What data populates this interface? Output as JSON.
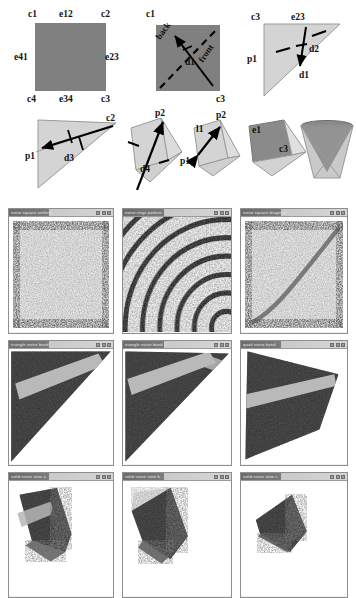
{
  "figure": {
    "domain": "paper-figure",
    "title_visible": false
  },
  "diagrams": {
    "row1": [
      {
        "id": "panel-square-corners",
        "shape": "square",
        "fill": "#808080",
        "labels": [
          {
            "text": "c1",
            "pos": "top-left"
          },
          {
            "text": "e12",
            "pos": "top-center"
          },
          {
            "text": "c2",
            "pos": "top-right"
          },
          {
            "text": "e41",
            "pos": "mid-left"
          },
          {
            "text": "e23",
            "pos": "mid-right"
          },
          {
            "text": "c4",
            "pos": "bottom-left"
          },
          {
            "text": "e34",
            "pos": "bottom-center"
          },
          {
            "text": "c3",
            "pos": "bottom-right"
          }
        ]
      },
      {
        "id": "panel-square-direction",
        "shape": "square",
        "fill": "#808080",
        "labels": [
          {
            "text": "c1",
            "pos": "top-left"
          },
          {
            "text": "c3",
            "pos": "bottom-right"
          },
          {
            "text": "back",
            "pos": "diagonal-upper"
          },
          {
            "text": "d1",
            "pos": "center"
          },
          {
            "text": "front",
            "pos": "diagonal-lower"
          }
        ]
      },
      {
        "id": "panel-triangle-d1-d2",
        "shape": "triangle",
        "fill": "#d4d4d4",
        "labels": [
          {
            "text": "c3",
            "pos": "top-left"
          },
          {
            "text": "e23",
            "pos": "top-center"
          },
          {
            "text": "p1",
            "pos": "mid-left"
          },
          {
            "text": "d2",
            "pos": "center"
          },
          {
            "text": "d1",
            "pos": "center-lower"
          }
        ]
      }
    ],
    "row2": [
      {
        "id": "panel-triangle-d3",
        "shape": "triangle",
        "fill": "#d4d4d4",
        "labels": [
          {
            "text": "c2",
            "pos": "top-right"
          },
          {
            "text": "p1",
            "pos": "mid-left"
          },
          {
            "text": "d3",
            "pos": "center"
          }
        ]
      },
      {
        "id": "panel-polyhedron-d4",
        "shape": "polyhedron",
        "fill": "#d4d4d4",
        "labels": [
          {
            "text": "p2",
            "pos": "top-right"
          },
          {
            "text": "d4",
            "pos": "center"
          }
        ]
      },
      {
        "id": "panel-polyhedron-l1",
        "shape": "polyhedron",
        "fill": "#d4d4d4",
        "labels": [
          {
            "text": "p2",
            "pos": "top-right"
          },
          {
            "text": "l1",
            "pos": "upper-left"
          },
          {
            "text": "p1",
            "pos": "mid-left"
          }
        ]
      },
      {
        "id": "panel-polyhedron-e1-c3",
        "shape": "polyhedron",
        "fill": "#d4d4d4",
        "labels": [
          {
            "text": "e1",
            "pos": "top-left"
          },
          {
            "text": "c3",
            "pos": "center"
          }
        ]
      },
      {
        "id": "panel-cone-wireframe",
        "shape": "cone-wireframe",
        "fill": "#8a8a8a",
        "labels": []
      }
    ]
  },
  "windows": {
    "columns": 3,
    "rows": 3,
    "controls": [
      "minimize",
      "maximize",
      "close"
    ],
    "items": [
      {
        "row": 1,
        "col": 1,
        "title": "noise square uniform",
        "content": "square-noise",
        "content_label": "uniform speckle square"
      },
      {
        "row": 1,
        "col": 2,
        "title": "noise rings pattern",
        "content": "ring-noise",
        "content_label": "concentric wavy bands"
      },
      {
        "row": 1,
        "col": 3,
        "title": "noise square diagonal",
        "content": "diagonal-noise",
        "content_label": "speckle square with diagonal ridge"
      },
      {
        "row": 2,
        "col": 1,
        "title": "triangle noise band",
        "content": "triangle-noise",
        "content_label": "dark triangle with light diagonal band"
      },
      {
        "row": 2,
        "col": 2,
        "title": "triangle noise band 2",
        "content": "triangle-noise-2",
        "content_label": "dark triangle with two light bands"
      },
      {
        "row": 2,
        "col": 3,
        "title": "quad noise band",
        "content": "quad-noise",
        "content_label": "dark quadrilateral with light band"
      },
      {
        "row": 3,
        "col": 1,
        "title": "solid noise view a",
        "content": "solid-noise-a",
        "content_label": "shaded polyhedron with noise faces"
      },
      {
        "row": 3,
        "col": 2,
        "title": "solid noise view b",
        "content": "solid-noise-b",
        "content_label": "shaded polyhedron with light top face"
      },
      {
        "row": 3,
        "col": 3,
        "title": "solid noise view c",
        "content": "solid-noise-c",
        "content_label": "shaded tetrahedron with noise faces"
      }
    ]
  },
  "colors": {
    "square_gray": "#808080",
    "triangle_gray": "#d4d4d4",
    "window_chrome": "#8e8e8e",
    "titlebar_dark": "#6d6d6d",
    "titlebar_light": "#d0d0d0",
    "canvas": "#ffffff"
  }
}
